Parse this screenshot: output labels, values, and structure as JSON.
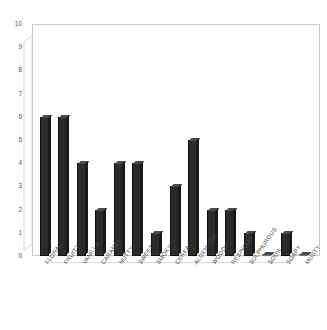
{
  "chart_data": {
    "type": "bar",
    "title": "",
    "subtitle": "",
    "xlabel": "",
    "ylabel": "",
    "ylim": [
      0,
      10
    ],
    "ytick_step": 1,
    "yticks": [
      "10",
      "9",
      "8",
      "7",
      "6",
      "5",
      "4",
      "3",
      "2",
      "1",
      "0"
    ],
    "grid": false,
    "legend": false,
    "legend_position": "none",
    "bar_color": "#2b2b2b",
    "categories": [
      "FLORAL",
      "FRUITY",
      "VANILLA",
      "CARAMEL",
      "NUTTY",
      "SWEET",
      "SMOKY",
      "CEREAL",
      "ALDEHYDIC",
      "WOODY",
      "RESINOUS",
      "SULPHUROUS",
      "SOUR",
      "SOAPY",
      "MUSTY"
    ],
    "values": [
      6,
      6,
      4,
      2,
      4,
      4,
      1,
      3,
      5,
      2,
      2,
      1,
      0,
      1,
      0
    ]
  },
  "style": {
    "background": "#ffffff",
    "axis_color": "#c9c9c9",
    "tick_text_color": "#555555",
    "label_text_color": "#4a4a4a"
  }
}
